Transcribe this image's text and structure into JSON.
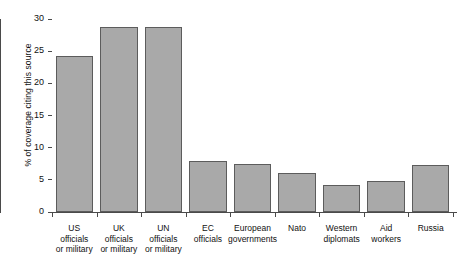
{
  "chart_data": {
    "type": "bar",
    "title": "",
    "xlabel": "",
    "ylabel": "% of coverage citing this source",
    "ylim": [
      0,
      30
    ],
    "yticks": [
      0,
      5,
      10,
      15,
      20,
      25,
      30
    ],
    "grid": false,
    "legend": false,
    "categories": [
      "US officials or military",
      "UK officials or military",
      "UN officials or military",
      "EC officials",
      "European governments",
      "Nato",
      "Western diplomats",
      "Aid workers",
      "Russia"
    ],
    "category_lines": [
      [
        "US",
        "officials",
        "or military"
      ],
      [
        "UK",
        "officials",
        "or military"
      ],
      [
        "UN",
        "officials",
        "or military"
      ],
      [
        "EC",
        "officials"
      ],
      [
        "European",
        "governments"
      ],
      [
        "Nato"
      ],
      [
        "Western",
        "diplomats"
      ],
      [
        "Aid",
        "workers"
      ],
      [
        "Russia"
      ]
    ],
    "values": [
      24.3,
      28.8,
      28.7,
      7.9,
      7.4,
      6.1,
      4.2,
      4.8,
      7.3
    ],
    "colors": {
      "bar_fill": "#a9a9a9",
      "bar_stroke": "#5c5c5c",
      "axis": "#4a4a4a",
      "text": "#111111",
      "background": "#ffffff"
    }
  }
}
